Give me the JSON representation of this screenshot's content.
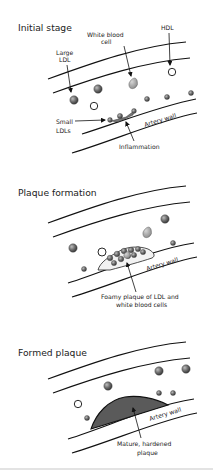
{
  "diagram": {
    "panels": [
      {
        "title": "Initial stage",
        "labels": {
          "large_ldl_line1": "Large",
          "large_ldl_line2": "LDL",
          "wbc_line1": "White blood",
          "wbc_line2": "cell",
          "hdl": "HDL",
          "small_ldls_line1": "Small",
          "small_ldls_line2": "LDLs",
          "artery_wall": "Artery wall",
          "inflammation": "Inflammation"
        }
      },
      {
        "title": "Plaque formation",
        "labels": {
          "artery_wall": "Artery wall",
          "foamy_line1": "Foamy plaque of LDL and",
          "foamy_line2": "white blood cells"
        }
      },
      {
        "title": "Formed plaque",
        "labels": {
          "artery_wall": "Artery wall",
          "mature_line1": "Mature, hardened",
          "mature_line2": "plaque"
        }
      }
    ],
    "colors": {
      "line": "#111111",
      "ldl_fill": "#6e6e6e",
      "plaque_fill": "#5a5a5a",
      "divider": "#c8c8c8",
      "background": "#ffffff"
    }
  }
}
